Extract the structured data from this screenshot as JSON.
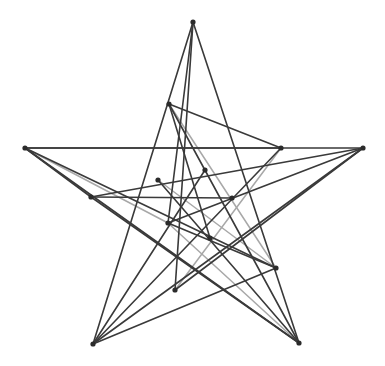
{
  "figure": {
    "kind": "line-art",
    "canvas": {
      "width": 385,
      "height": 366
    },
    "background_color": "#ffffff",
    "stroke_colors": {
      "dark": "#3a3a3a",
      "mid": "#555555",
      "light": "#a8a8a8"
    },
    "vertex_color": "#2b2b2b",
    "vertex_radius": 2.6,
    "stroke_width": 1.6
  },
  "chart_data": {
    "type": "scatter",
    "xlabel": "",
    "ylabel": "",
    "xlim": [
      0,
      385
    ],
    "ylim": [
      0,
      366
    ],
    "grid": false,
    "legend": "none",
    "note": "Straight-line segments connecting labelled vertices of a five-pointed star plus interior points.",
    "vertices": [
      {
        "id": "T",
        "label": "top-tip",
        "x": 193,
        "y": 22
      },
      {
        "id": "L",
        "label": "left-tip",
        "x": 25,
        "y": 148
      },
      {
        "id": "R",
        "label": "right-tip",
        "x": 363,
        "y": 148
      },
      {
        "id": "BL",
        "label": "bottom-left-tip",
        "x": 93,
        "y": 344
      },
      {
        "id": "BR",
        "label": "bottom-right-tip",
        "x": 299,
        "y": 343
      },
      {
        "id": "A",
        "label": "upper-inner-left",
        "x": 169,
        "y": 104
      },
      {
        "id": "B",
        "label": "right-shoulder",
        "x": 281,
        "y": 148
      },
      {
        "id": "C",
        "label": "left-shoulder",
        "x": 91,
        "y": 197
      },
      {
        "id": "D",
        "label": "mid-inner-left",
        "x": 168,
        "y": 223
      },
      {
        "id": "E",
        "label": "lower-inner-right",
        "x": 276,
        "y": 268
      },
      {
        "id": "F",
        "label": "center-upper",
        "x": 205,
        "y": 170
      },
      {
        "id": "G",
        "label": "center-right",
        "x": 232,
        "y": 198
      },
      {
        "id": "H",
        "label": "center-lower",
        "x": 210,
        "y": 238
      },
      {
        "id": "I",
        "label": "center-left",
        "x": 158,
        "y": 180
      },
      {
        "id": "J",
        "label": "lower-center",
        "x": 175,
        "y": 290
      }
    ],
    "edges": [
      {
        "from": "L",
        "to": "R",
        "shade": "dark"
      },
      {
        "from": "L",
        "to": "B",
        "shade": "dark"
      },
      {
        "from": "L",
        "to": "E",
        "shade": "dark"
      },
      {
        "from": "L",
        "to": "BR",
        "shade": "dark"
      },
      {
        "from": "L",
        "to": "D",
        "shade": "light"
      },
      {
        "from": "L",
        "to": "C",
        "shade": "dark"
      },
      {
        "from": "R",
        "to": "C",
        "shade": "dark"
      },
      {
        "from": "R",
        "to": "D",
        "shade": "dark"
      },
      {
        "from": "R",
        "to": "BL",
        "shade": "dark"
      },
      {
        "from": "R",
        "to": "J",
        "shade": "dark"
      },
      {
        "from": "T",
        "to": "BL",
        "shade": "dark"
      },
      {
        "from": "T",
        "to": "BR",
        "shade": "dark"
      },
      {
        "from": "T",
        "to": "D",
        "shade": "dark"
      },
      {
        "from": "T",
        "to": "J",
        "shade": "dark"
      },
      {
        "from": "A",
        "to": "BR",
        "shade": "dark"
      },
      {
        "from": "A",
        "to": "E",
        "shade": "light"
      },
      {
        "from": "A",
        "to": "B",
        "shade": "dark"
      },
      {
        "from": "A",
        "to": "H",
        "shade": "dark"
      },
      {
        "from": "BL",
        "to": "B",
        "shade": "dark"
      },
      {
        "from": "BL",
        "to": "E",
        "shade": "dark"
      },
      {
        "from": "BL",
        "to": "F",
        "shade": "dark"
      },
      {
        "from": "BR",
        "to": "C",
        "shade": "dark"
      },
      {
        "from": "BR",
        "to": "I",
        "shade": "dark"
      },
      {
        "from": "BR",
        "to": "D",
        "shade": "light"
      },
      {
        "from": "B",
        "to": "J",
        "shade": "light"
      },
      {
        "from": "C",
        "to": "G",
        "shade": "dark"
      },
      {
        "from": "D",
        "to": "E",
        "shade": "dark"
      },
      {
        "from": "E",
        "to": "I",
        "shade": "light"
      }
    ]
  }
}
